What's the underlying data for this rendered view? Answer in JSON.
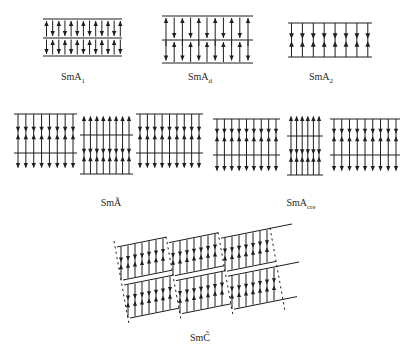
{
  "canvas": {
    "width": 405,
    "height": 358,
    "background": "#ffffff",
    "ink": "#1f1f1f"
  },
  "labels": [
    {
      "id": "sma1",
      "base": "SmA",
      "sub": "1",
      "x": 73,
      "y": 72
    },
    {
      "id": "smad",
      "base": "SmA",
      "sub": "d",
      "x": 200,
      "y": 72
    },
    {
      "id": "sma2",
      "base": "SmA",
      "sub": "2",
      "x": 321,
      "y": 72
    },
    {
      "id": "smatilde",
      "base": "SmÃ",
      "sub": "",
      "x": 111,
      "y": 198
    },
    {
      "id": "smacre",
      "base": "SmA",
      "sub": "cre",
      "x": 301,
      "y": 198
    },
    {
      "id": "smctilde",
      "base": "SmC̃",
      "sub": "",
      "x": 200,
      "y": 333
    }
  ],
  "panels": [
    {
      "id": "sma1",
      "kind": "alt",
      "x1": 43,
      "x2": 122,
      "lines": [
        19,
        38,
        56
      ],
      "arrowX1": 46.5,
      "arrowStep": 6.15,
      "n": 13,
      "layers": [
        {
          "top": 19,
          "bot": 38,
          "phase": 0
        },
        {
          "top": 38,
          "bot": 56,
          "phase": 1
        }
      ]
    },
    {
      "id": "smad",
      "kind": "inter",
      "x1": 162,
      "x2": 253,
      "lines": [
        16,
        40,
        63
      ],
      "arrowX1": 166,
      "arrowStep": 8.2,
      "n": 11,
      "layers": [
        {
          "phase": 0,
          "upTip": 18,
          "upTail": 46,
          "dnTail": 17.5,
          "dnTip": 38
        },
        {
          "phase": 1,
          "upTip": 42,
          "upTail": 62,
          "dnTail": 41,
          "dnTip": 60.5
        }
      ]
    },
    {
      "id": "sma2",
      "kind": "bilayer",
      "x1": 288,
      "x2": 372,
      "topY": 23,
      "botY": 57,
      "arrowX1": 291.5,
      "arrowStep": 10.9,
      "n": 8,
      "pairY": 40
    },
    {
      "id": "smatilde",
      "kind": "antiphase",
      "yA": {
        "top": 114,
        "pair": 133,
        "mid": 153,
        "tip": 168
      },
      "yB": {
        "tip": 116,
        "top": 135,
        "pair": 155,
        "bot": 174
      },
      "blocks": [
        {
          "v": "A",
          "x1": 14,
          "x2": 77,
          "n": 8
        },
        {
          "v": "B",
          "x1": 80,
          "x2": 133,
          "n": 8
        },
        {
          "v": "A",
          "x1": 136,
          "x2": 203,
          "n": 9
        }
      ]
    },
    {
      "id": "smacre",
      "kind": "antiphase",
      "yA": {
        "top": 119,
        "pair": 135,
        "mid": 155,
        "tip": 171
      },
      "yB": {
        "tip": 116,
        "top": 136,
        "pair": 155.5,
        "bot": 175
      },
      "blocks": [
        {
          "v": "A",
          "x1": 213,
          "x2": 280,
          "n": 9
        },
        {
          "v": "B",
          "x1": 287,
          "x2": 323,
          "n": 6
        },
        {
          "v": "A",
          "x1": 330,
          "x2": 400,
          "n": 9
        }
      ]
    },
    {
      "id": "smctilde",
      "kind": "tilted",
      "origin": {
        "x": 117,
        "y": 247
      },
      "cols": 3,
      "rows": 2,
      "colStep": 52,
      "colDy": -4.4,
      "rowDx": 7,
      "rowDy": 38,
      "W": 49,
      "H": 33,
      "slope": -0.2,
      "bottomShift": 6,
      "nMol": 7,
      "molInset": 4,
      "molStep": 7,
      "dash": {
        "count": 4,
        "leftPad": 3,
        "topPad": 6,
        "len": 82,
        "dxdy": 0.18
      },
      "tailLen": 22,
      "bottomTail": 14
    }
  ]
}
